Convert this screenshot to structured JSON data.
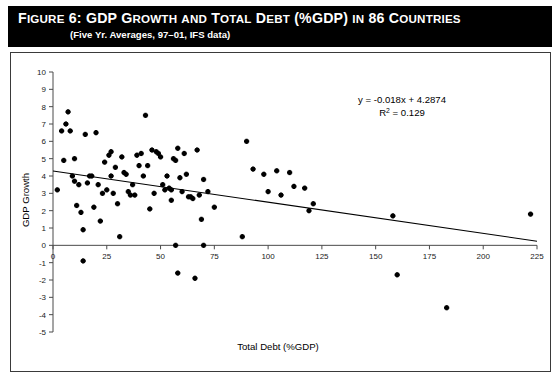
{
  "figure": {
    "label": "Figure 6:",
    "title_rest": "GDP Growth and Total Debt (%GDP) in 86 Countries",
    "title_full": "Figure 6:  GDP Growth and Total Debt (%GDP) in 86 Countries",
    "subtitle": "(Five Yr. Averages, 97–01, IFS data)"
  },
  "annotations": {
    "equation": "y = -0.018x + 4.2874",
    "r_squared_prefix": "R",
    "r_squared_exp": "2",
    "r_squared_value": "= 0.129",
    "r_squared_full": "R2 = 0.129"
  },
  "colors": {
    "header_background": "#000000",
    "header_text": "#ffffff",
    "plot_border": "#3a3a3a",
    "axis": "#4a4a4a",
    "point": "#000000",
    "trend": "#000000",
    "background": "#ffffff"
  },
  "chart_data": {
    "type": "scatter",
    "title": "Figure 6:  GDP Growth and Total Debt (%GDP) in 86 Countries",
    "subtitle": "(Five Yr. Averages, 97–01, IFS data)",
    "xlabel": "Total Debt (%GDP)",
    "ylabel": "GDP Growth",
    "xlim": [
      0,
      225
    ],
    "ylim": [
      -5,
      10
    ],
    "xticks": [
      0,
      25,
      50,
      75,
      100,
      125,
      150,
      175,
      200,
      225
    ],
    "yticks": [
      -5,
      -4,
      -3,
      -2,
      -1,
      0,
      1,
      2,
      3,
      4,
      5,
      6,
      7,
      8,
      9,
      10
    ],
    "grid": false,
    "legend": false,
    "n_points": 86,
    "trendline": {
      "type": "linear",
      "slope": -0.018,
      "intercept": 4.2874,
      "r_squared": 0.129,
      "equation": "y = -0.018x + 4.2874",
      "x_start": 0,
      "x_end": 225
    },
    "points": [
      [
        2,
        3.2
      ],
      [
        4,
        6.6
      ],
      [
        5,
        4.9
      ],
      [
        6,
        7.0
      ],
      [
        7,
        7.7
      ],
      [
        8,
        6.6
      ],
      [
        9,
        4.0
      ],
      [
        10,
        3.7
      ],
      [
        10,
        5.0
      ],
      [
        11,
        2.3
      ],
      [
        12,
        3.5
      ],
      [
        13,
        1.9
      ],
      [
        14,
        0.9
      ],
      [
        14,
        -0.9
      ],
      [
        15,
        6.4
      ],
      [
        16,
        3.6
      ],
      [
        17,
        4.0
      ],
      [
        18,
        4.0
      ],
      [
        19,
        2.2
      ],
      [
        20,
        6.5
      ],
      [
        21,
        3.5
      ],
      [
        22,
        1.4
      ],
      [
        23,
        3.0
      ],
      [
        24,
        4.8
      ],
      [
        25,
        3.2
      ],
      [
        26,
        5.2
      ],
      [
        27,
        5.4
      ],
      [
        27,
        4.0
      ],
      [
        28,
        3.0
      ],
      [
        29,
        4.5
      ],
      [
        30,
        2.4
      ],
      [
        31,
        0.5
      ],
      [
        32,
        5.1
      ],
      [
        33,
        4.2
      ],
      [
        34,
        4.1
      ],
      [
        35,
        3.1
      ],
      [
        36,
        2.9
      ],
      [
        37,
        3.5
      ],
      [
        38,
        2.9
      ],
      [
        39,
        5.2
      ],
      [
        40,
        4.6
      ],
      [
        41,
        5.3
      ],
      [
        42,
        4.0
      ],
      [
        43,
        7.5
      ],
      [
        44,
        4.6
      ],
      [
        45,
        2.1
      ],
      [
        46,
        5.5
      ],
      [
        47,
        3.0
      ],
      [
        48,
        5.4
      ],
      [
        49,
        5.3
      ],
      [
        50,
        5.1
      ],
      [
        51,
        3.5
      ],
      [
        52,
        3.2
      ],
      [
        53,
        4.0
      ],
      [
        54,
        3.3
      ],
      [
        55,
        3.2
      ],
      [
        55,
        2.6
      ],
      [
        56,
        5.0
      ],
      [
        57,
        4.9
      ],
      [
        57,
        0.0
      ],
      [
        58,
        5.6
      ],
      [
        58,
        -1.6
      ],
      [
        59,
        3.9
      ],
      [
        60,
        3.1
      ],
      [
        61,
        5.3
      ],
      [
        62,
        4.1
      ],
      [
        63,
        2.8
      ],
      [
        64,
        2.8
      ],
      [
        65,
        2.7
      ],
      [
        66,
        -1.9
      ],
      [
        67,
        5.5
      ],
      [
        68,
        2.9
      ],
      [
        69,
        1.5
      ],
      [
        70,
        3.8
      ],
      [
        70,
        0.0
      ],
      [
        72,
        3.1
      ],
      [
        75,
        2.2
      ],
      [
        88,
        0.5
      ],
      [
        90,
        6.0
      ],
      [
        93,
        4.4
      ],
      [
        98,
        4.1
      ],
      [
        100,
        3.1
      ],
      [
        104,
        4.3
      ],
      [
        106,
        2.9
      ],
      [
        110,
        4.2
      ],
      [
        112,
        3.4
      ],
      [
        117,
        3.3
      ],
      [
        119,
        2.0
      ],
      [
        121,
        2.4
      ],
      [
        158,
        1.7
      ],
      [
        160,
        -1.7
      ],
      [
        183,
        -3.6
      ],
      [
        222,
        1.8
      ]
    ]
  }
}
